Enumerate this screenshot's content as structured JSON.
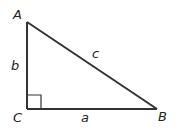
{
  "diagram": {
    "type": "right-triangle",
    "colors": {
      "stroke": "#333333",
      "text": "#222222",
      "background": "#ffffff"
    },
    "vertices": {
      "A": {
        "label": "A",
        "x": 27,
        "y": 22
      },
      "B": {
        "label": "B",
        "x": 157,
        "y": 109
      },
      "C": {
        "label": "C",
        "x": 27,
        "y": 109
      }
    },
    "sides": {
      "a": {
        "label": "a",
        "from": "C",
        "to": "B"
      },
      "b": {
        "label": "b",
        "from": "C",
        "to": "A"
      },
      "c": {
        "label": "c",
        "from": "A",
        "to": "B"
      }
    },
    "right_angle_at": "C"
  }
}
